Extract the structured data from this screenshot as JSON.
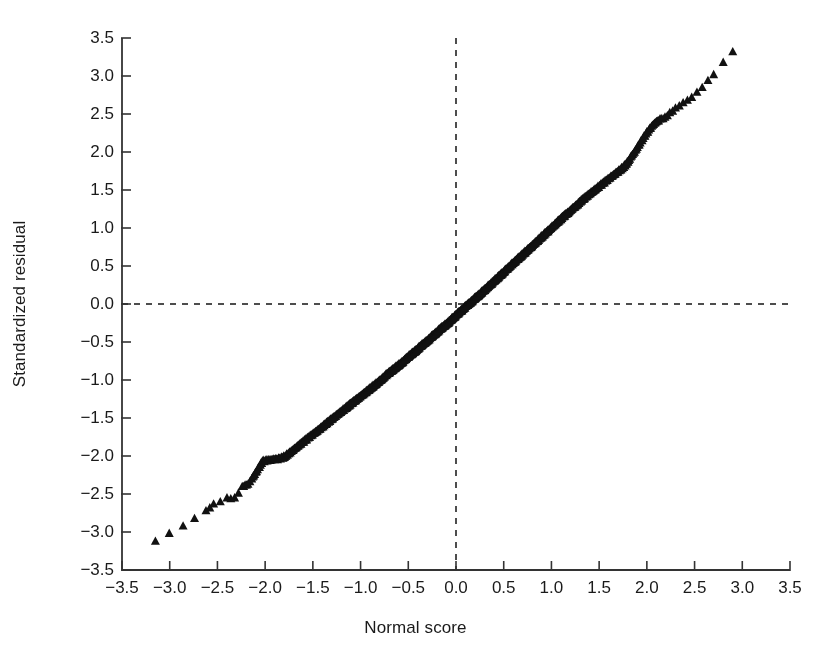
{
  "chart_data": {
    "type": "scatter",
    "title": "",
    "xlabel": "Normal score",
    "ylabel": "Standardized residual",
    "xlim": [
      -3.5,
      3.5
    ],
    "ylim": [
      -3.5,
      3.5
    ],
    "xticks": [
      "−3.5",
      "−3.0",
      "−2.5",
      "−2.0",
      "−1.5",
      "−1.0",
      "−0.5",
      "0.0",
      "0.5",
      "1.0",
      "1.5",
      "2.0",
      "2.5",
      "3.0",
      "3.5"
    ],
    "xtick_values": [
      -3.5,
      -3.0,
      -2.5,
      -2.0,
      -1.5,
      -1.0,
      -0.5,
      0.0,
      0.5,
      1.0,
      1.5,
      2.0,
      2.5,
      3.0,
      3.5
    ],
    "yticks": [
      "−3.5",
      "−3.0",
      "−2.5",
      "−2.0",
      "−1.5",
      "−1.0",
      "−0.5",
      "0.0",
      "0.5",
      "1.0",
      "1.5",
      "2.0",
      "2.5",
      "3.0",
      "3.5"
    ],
    "ytick_values": [
      -3.5,
      -3.0,
      -2.5,
      -2.0,
      -1.5,
      -1.0,
      -0.5,
      0.0,
      0.5,
      1.0,
      1.5,
      2.0,
      2.5,
      3.0,
      3.5
    ],
    "grid": false,
    "legend": null,
    "marker": "triangle-up",
    "marker_color": "#111111",
    "marker_size_px": 9,
    "reference_lines": [
      {
        "name": "vertical-zero-line",
        "orientation": "vertical",
        "value": 0.0,
        "style": "dashed",
        "color": "#222222"
      },
      {
        "name": "horizontal-zero-line",
        "orientation": "horizontal",
        "value": 0.0,
        "style": "dashed",
        "color": "#222222"
      }
    ],
    "axis_color": "#333333",
    "background": "#ffffff",
    "n_points": 640,
    "points": [
      [
        -3.15,
        -3.12
      ],
      [
        -2.86,
        -2.92
      ],
      [
        -2.62,
        -2.72
      ],
      [
        -2.54,
        -2.63
      ],
      [
        -2.4,
        -2.55
      ],
      [
        -2.32,
        -2.55
      ],
      [
        -2.24,
        -2.4
      ],
      [
        -2.21,
        -2.38
      ],
      [
        -2.18,
        -2.37
      ],
      [
        -2.14,
        -2.3
      ],
      [
        -2.11,
        -2.24
      ],
      [
        -2.08,
        -2.18
      ],
      [
        -2.05,
        -2.12
      ],
      [
        -2.03,
        -2.07
      ],
      [
        -2.0,
        -2.06
      ],
      [
        -1.97,
        -2.05
      ],
      [
        -1.94,
        -2.05
      ],
      [
        -1.91,
        -2.04
      ],
      [
        -1.88,
        -2.04
      ],
      [
        -1.85,
        -2.03
      ],
      [
        -1.82,
        -2.02
      ],
      [
        -1.79,
        -2.0
      ],
      [
        -1.76,
        -1.97
      ],
      [
        -1.73,
        -1.94
      ],
      [
        -1.7,
        -1.91
      ],
      [
        -1.67,
        -1.88
      ],
      [
        -1.64,
        -1.85
      ],
      [
        -1.61,
        -1.82
      ],
      [
        -1.58,
        -1.79
      ],
      [
        -1.55,
        -1.76
      ],
      [
        -1.52,
        -1.73
      ],
      [
        -1.49,
        -1.7
      ],
      [
        -1.46,
        -1.67
      ],
      [
        -1.43,
        -1.64
      ],
      [
        -1.4,
        -1.61
      ],
      [
        -1.37,
        -1.58
      ],
      [
        -1.34,
        -1.55
      ],
      [
        -1.31,
        -1.52
      ],
      [
        -1.28,
        -1.49
      ],
      [
        -1.25,
        -1.46
      ],
      [
        -1.22,
        -1.43
      ],
      [
        -1.19,
        -1.4
      ],
      [
        -1.16,
        -1.37
      ],
      [
        -1.13,
        -1.34
      ],
      [
        -1.1,
        -1.31
      ],
      [
        -1.07,
        -1.28
      ],
      [
        -1.04,
        -1.25
      ],
      [
        -1.01,
        -1.22
      ],
      [
        -0.98,
        -1.19
      ],
      [
        -0.95,
        -1.16
      ],
      [
        -0.92,
        -1.13
      ],
      [
        -0.89,
        -1.1
      ],
      [
        -0.86,
        -1.07
      ],
      [
        -0.83,
        -1.04
      ],
      [
        -0.8,
        -1.01
      ],
      [
        -0.77,
        -0.98
      ],
      [
        -0.74,
        -0.94
      ],
      [
        -0.71,
        -0.91
      ],
      [
        -0.68,
        -0.88
      ],
      [
        -0.65,
        -0.85
      ],
      [
        -0.62,
        -0.82
      ],
      [
        -0.59,
        -0.79
      ],
      [
        -0.56,
        -0.76
      ],
      [
        -0.53,
        -0.72
      ],
      [
        -0.5,
        -0.69
      ],
      [
        -0.47,
        -0.66
      ],
      [
        -0.44,
        -0.63
      ],
      [
        -0.41,
        -0.6
      ],
      [
        -0.38,
        -0.56
      ],
      [
        -0.35,
        -0.53
      ],
      [
        -0.32,
        -0.5
      ],
      [
        -0.29,
        -0.47
      ],
      [
        -0.26,
        -0.43
      ],
      [
        -0.23,
        -0.4
      ],
      [
        -0.2,
        -0.37
      ],
      [
        -0.17,
        -0.33
      ],
      [
        -0.14,
        -0.3
      ],
      [
        -0.11,
        -0.27
      ],
      [
        -0.08,
        -0.24
      ],
      [
        -0.05,
        -0.2
      ],
      [
        -0.02,
        -0.17
      ],
      [
        0.01,
        -0.13
      ],
      [
        0.04,
        -0.1
      ],
      [
        0.07,
        -0.07
      ],
      [
        0.1,
        -0.03
      ],
      [
        0.13,
        0.0
      ],
      [
        0.16,
        0.03
      ],
      [
        0.19,
        0.07
      ],
      [
        0.22,
        0.1
      ],
      [
        0.25,
        0.13
      ],
      [
        0.28,
        0.17
      ],
      [
        0.31,
        0.2
      ],
      [
        0.34,
        0.24
      ],
      [
        0.37,
        0.27
      ],
      [
        0.4,
        0.31
      ],
      [
        0.43,
        0.34
      ],
      [
        0.46,
        0.38
      ],
      [
        0.49,
        0.41
      ],
      [
        0.52,
        0.45
      ],
      [
        0.55,
        0.48
      ],
      [
        0.58,
        0.52
      ],
      [
        0.61,
        0.55
      ],
      [
        0.64,
        0.59
      ],
      [
        0.67,
        0.62
      ],
      [
        0.7,
        0.66
      ],
      [
        0.73,
        0.69
      ],
      [
        0.76,
        0.73
      ],
      [
        0.79,
        0.76
      ],
      [
        0.82,
        0.8
      ],
      [
        0.85,
        0.83
      ],
      [
        0.88,
        0.87
      ],
      [
        0.91,
        0.9
      ],
      [
        0.94,
        0.94
      ],
      [
        0.97,
        0.97
      ],
      [
        1.0,
        1.01
      ],
      [
        1.03,
        1.04
      ],
      [
        1.06,
        1.08
      ],
      [
        1.09,
        1.11
      ],
      [
        1.12,
        1.15
      ],
      [
        1.15,
        1.18
      ],
      [
        1.18,
        1.21
      ],
      [
        1.21,
        1.25
      ],
      [
        1.24,
        1.28
      ],
      [
        1.27,
        1.31
      ],
      [
        1.3,
        1.35
      ],
      [
        1.33,
        1.38
      ],
      [
        1.36,
        1.41
      ],
      [
        1.39,
        1.44
      ],
      [
        1.42,
        1.47
      ],
      [
        1.45,
        1.5
      ],
      [
        1.48,
        1.53
      ],
      [
        1.51,
        1.56
      ],
      [
        1.54,
        1.59
      ],
      [
        1.57,
        1.62
      ],
      [
        1.6,
        1.65
      ],
      [
        1.63,
        1.68
      ],
      [
        1.66,
        1.71
      ],
      [
        1.69,
        1.74
      ],
      [
        1.72,
        1.77
      ],
      [
        1.75,
        1.8
      ],
      [
        1.78,
        1.84
      ],
      [
        1.81,
        1.89
      ],
      [
        1.84,
        1.95
      ],
      [
        1.87,
        2.0
      ],
      [
        1.9,
        2.06
      ],
      [
        1.93,
        2.12
      ],
      [
        1.96,
        2.18
      ],
      [
        1.99,
        2.24
      ],
      [
        2.02,
        2.29
      ],
      [
        2.05,
        2.34
      ],
      [
        2.08,
        2.38
      ],
      [
        2.11,
        2.41
      ],
      [
        2.15,
        2.44
      ],
      [
        2.19,
        2.46
      ],
      [
        2.24,
        2.52
      ],
      [
        2.3,
        2.58
      ],
      [
        2.38,
        2.65
      ],
      [
        2.47,
        2.72
      ],
      [
        2.58,
        2.85
      ],
      [
        2.7,
        3.02
      ],
      [
        2.9,
        3.32
      ]
    ]
  }
}
